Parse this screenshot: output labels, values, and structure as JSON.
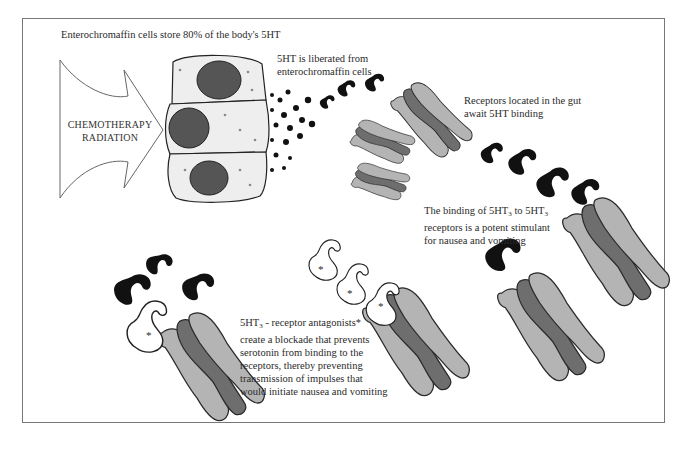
{
  "figure": {
    "title_label": "Enterochromaffin cells store 80% of the body's  5HT",
    "arrow": {
      "line1": "CHEMOTHERAPY",
      "line2": "RADIATION"
    },
    "labels": {
      "liberated_line1": "5HT is liberated from",
      "liberated_line2": "enterochromaffin cells",
      "receptors_line1": "Receptors located in the gut",
      "receptors_line2": "await 5HT binding",
      "binding_line1_a": "The binding of 5HT",
      "binding_line1_sub1": "3",
      "binding_line1_b": " to 5HT",
      "binding_line1_sub2": "3",
      "binding_line2": "receptors is a potent stimulant",
      "binding_line3": "for nausea and vomiting",
      "antagonist_line1_a": "5HT",
      "antagonist_line1_sub": "3",
      "antagonist_line1_b": " - receptor antagonists*",
      "antagonist_line2": "create a blockade that prevents",
      "antagonist_line3": "serotonin from binding to the",
      "antagonist_line4": "receptors, thereby preventing",
      "antagonist_line5": "transmission of impulses that",
      "antagonist_line6": "would initiate nausea and vomiting"
    },
    "antagonist_marker": "*",
    "colors": {
      "serotonin": "#111111",
      "receptor_light": "#b4b4b4",
      "receptor_dark": "#6e6e6e",
      "outline": "#2a2a2a",
      "frame": "#777777"
    }
  }
}
